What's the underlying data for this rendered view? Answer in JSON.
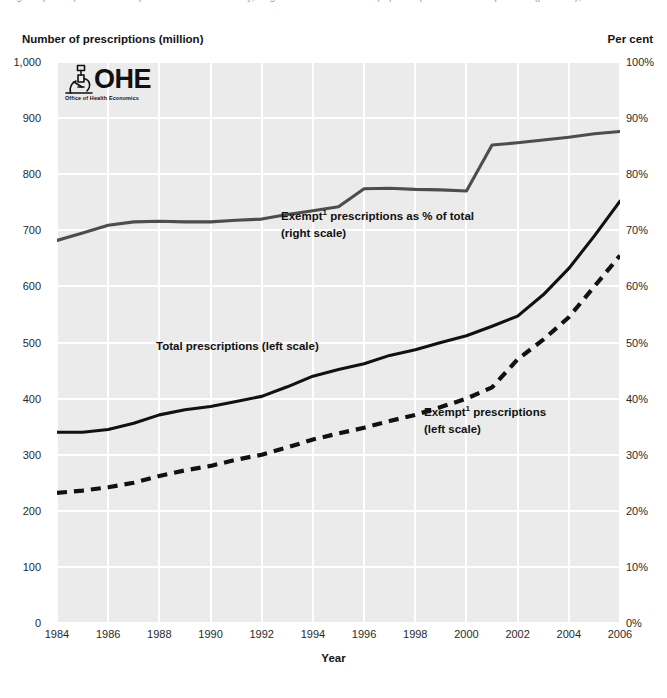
{
  "header": {
    "clipped_caption": "Figure: prescription items dispensed in the community, England — total and exempt prescriptions and exempt share (per cent), 1984 to 2006.  Source"
  },
  "logo": {
    "name": "OHE",
    "tagline": "Office of Health Economics",
    "icon": "microscope-icon"
  },
  "chart_data": {
    "type": "line",
    "title": "",
    "xlabel": "Year",
    "ylabel": "Number of prescriptions (million)",
    "y2label": "Per cent",
    "xlim": [
      1984,
      2006
    ],
    "ylim": [
      0,
      1000
    ],
    "y2lim": [
      0,
      100
    ],
    "grid": true,
    "legend": "annotations-in-plot",
    "x": [
      1984,
      1985,
      1986,
      1987,
      1988,
      1989,
      1990,
      1991,
      1992,
      1993,
      1994,
      1995,
      1996,
      1997,
      1998,
      1999,
      2000,
      2001,
      2002,
      2003,
      2004,
      2005,
      2006
    ],
    "xticks": [
      "1984",
      "1986",
      "1988",
      "1990",
      "1992",
      "1994",
      "1996",
      "1998",
      "2000",
      "2002",
      "2004",
      "2006"
    ],
    "yticks": [
      "0",
      "100",
      "200",
      "300",
      "400",
      "500",
      "600",
      "700",
      "800",
      "900",
      "1,000"
    ],
    "y2ticks": [
      "0%",
      "10%",
      "20%",
      "30%",
      "40%",
      "50%",
      "60%",
      "70%",
      "80%",
      "90%",
      "100%"
    ],
    "series": [
      {
        "name": "Total prescriptions (left scale)",
        "axis": "left",
        "style": "solid",
        "color": "#111111",
        "values": [
          340,
          340,
          345,
          356,
          371,
          380,
          386,
          395,
          404,
          421,
          440,
          452,
          462,
          477,
          487,
          500,
          512,
          529,
          547,
          585,
          632,
          690,
          752
        ]
      },
      {
        "name": "Exempt prescriptions (left scale)",
        "axis": "left",
        "style": "dashed",
        "color": "#111111",
        "values": [
          232,
          236,
          242,
          250,
          262,
          272,
          280,
          291,
          300,
          313,
          327,
          338,
          348,
          360,
          371,
          385,
          400,
          420,
          470,
          505,
          545,
          600,
          655
        ]
      },
      {
        "name": "Exempt prescriptions as % of total (right scale)",
        "axis": "right",
        "style": "solid",
        "color": "#4d4d4d",
        "values": [
          68.2,
          69.5,
          70.9,
          71.5,
          71.6,
          71.5,
          71.5,
          71.8,
          72.0,
          72.8,
          73.5,
          74.2,
          77.4,
          77.5,
          77.3,
          77.2,
          77.0,
          85.2,
          85.6,
          86.1,
          86.6,
          87.2,
          87.6
        ]
      }
    ],
    "annotations": [
      {
        "id": "pct",
        "line1": "Exempt",
        "sup": "1",
        "line1b": " prescriptions as % of total",
        "line2": "(right  scale)"
      },
      {
        "id": "total",
        "line1": "Total prescriptions (left scale)",
        "sup": "",
        "line1b": "",
        "line2": ""
      },
      {
        "id": "exempt",
        "line1": "Exempt",
        "sup": "1",
        "line1b": " prescriptions",
        "line2": "(left scale)"
      }
    ]
  }
}
